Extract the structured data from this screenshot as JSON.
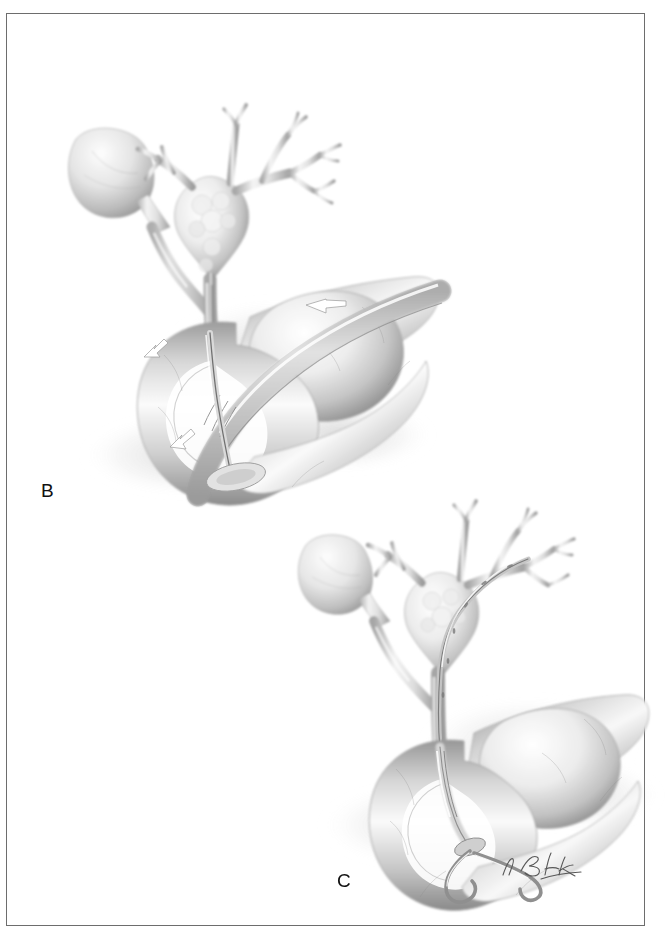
{
  "figure": {
    "kind": "medical-illustration",
    "medium": "graphite pencil rendering, grayscale",
    "background_color": "#ffffff",
    "border_color": "#2b2b2b",
    "panels": [
      {
        "id": "B",
        "label": "B",
        "caption_position": "left-middle",
        "description": "Duodenoscope within the duodenum with guidewire advanced through the papilla into the common bile duct; gallbladder and intrahepatic biliary tree shown above",
        "structures": [
          "gallbladder",
          "cystic duct",
          "common hepatic duct",
          "right and left hepatic ducts",
          "intrahepatic biliary radicles",
          "common bile duct",
          "duodenum",
          "duodenoscope",
          "guidewire"
        ],
        "arrows": [
          {
            "name": "scope-direction-arrow",
            "points": "left",
            "location": "upper duodenum"
          },
          {
            "name": "lumen-arrow-upper-left",
            "points": "down-left",
            "location": "duodenal bulb"
          },
          {
            "name": "papilla-arrow",
            "points": "right",
            "location": "papilla of Vater"
          }
        ]
      },
      {
        "id": "C",
        "label": "C",
        "caption_position": "bottom-center",
        "description": "Double-pigtail endoprosthesis in final position traversing the hilar stricture, with distal pigtail coiled in the duodenal lumen",
        "structures": [
          "gallbladder",
          "cystic duct",
          "hilar confluence",
          "right and left hepatic ducts",
          "common bile duct",
          "duodenum",
          "double-pigtail biliary stent"
        ],
        "arrows": []
      }
    ],
    "signature": {
      "name": "artist-signature",
      "text": "T. Bick",
      "style": "handwritten cursive"
    },
    "palette": {
      "ink": "#2b2b2b",
      "tissue_light": "#f2f2f2",
      "tissue_mid": "#c9c9c9",
      "tissue_dark": "#8f8f8f",
      "shadow": "#6e6e6e",
      "vessel_line": "#7a7a7a",
      "highlight": "#ffffff",
      "arrow_fill": "#ffffff",
      "arrow_stroke": "#8a8a8a"
    }
  }
}
